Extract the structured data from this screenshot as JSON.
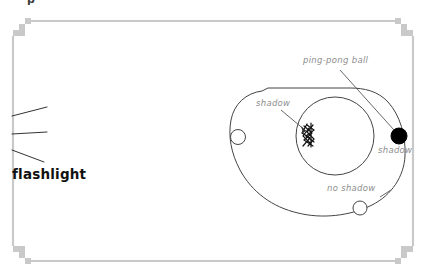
{
  "page": {
    "background_color": "#ffffff",
    "width": 427,
    "height": 278
  },
  "frame": {
    "name": "decorative-worksheet-border",
    "stroke_color": "#c9c9c9",
    "corner_style": "stepped-pixel",
    "left": 12,
    "top": 20,
    "right": 414,
    "bottom": 262
  },
  "clipped_header": {
    "text": "p"
  },
  "flashlight": {
    "label": "flashlight",
    "label_color": "#111111",
    "rays": [
      {
        "name": "ray-upper",
        "x1": 12,
        "y1": 116,
        "x2": 47,
        "y2": 107
      },
      {
        "name": "ray-middle",
        "x1": 12,
        "y1": 134,
        "x2": 47,
        "y2": 132
      },
      {
        "name": "ray-lower",
        "x1": 12,
        "y1": 150,
        "x2": 44,
        "y2": 162
      }
    ],
    "ray_color": "#333333"
  },
  "diagram": {
    "orbit_path": {
      "name": "orbit-path",
      "stroke_color": "#444444",
      "description": "closed irregular elliptical orbit loop"
    },
    "inner_circle": {
      "name": "inner-sphere",
      "cx": 335,
      "cy": 136,
      "r": 39,
      "stroke_color": "#444444"
    },
    "shadow_scribble": {
      "name": "shadow-scribble",
      "color": "#111111",
      "description": "dark zigzag scribble marking the shadow region"
    },
    "balls": [
      {
        "name": "ball-left-white",
        "cx": 238,
        "cy": 137,
        "r": 7.5,
        "fill": "#ffffff",
        "stroke": "#444444",
        "state": "shadow"
      },
      {
        "name": "ball-right-black",
        "cx": 399,
        "cy": 136,
        "r": 8,
        "fill": "#000000",
        "stroke": "#000000",
        "state": "shadow"
      },
      {
        "name": "ball-bottom-white",
        "cx": 360,
        "cy": 208,
        "r": 7,
        "fill": "#ffffff",
        "stroke": "#444444",
        "state": "no shadow"
      }
    ],
    "annotations": [
      {
        "name": "ping-pong-ball-annotation",
        "text": "ping-pong ball",
        "color": "#8e8e8e",
        "leader_line": {
          "x1": 340,
          "y1": 70,
          "x2": 394,
          "y2": 130
        }
      },
      {
        "name": "shadow-annotation-left",
        "text": "shadow",
        "color": "#8e8e8e",
        "leader_line": {
          "x1": 281,
          "y1": 110,
          "x2": 306,
          "y2": 131
        }
      },
      {
        "name": "shadow-annotation-right",
        "text": "shadow",
        "color": "#8e8e8e",
        "leader_line": null
      },
      {
        "name": "no-shadow-annotation",
        "text": "no shadow",
        "color": "#8e8e8e",
        "leader_line": {
          "x1": 378,
          "y1": 196,
          "x2": 390,
          "y2": 189
        }
      }
    ]
  }
}
